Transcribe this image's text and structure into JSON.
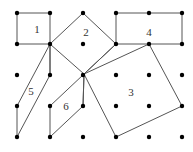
{
  "diagram": {
    "title": "",
    "line_color": "#555555",
    "dot_color": "#000000",
    "grid": {
      "xs": [
        17,
        50,
        83,
        116,
        149,
        182
      ],
      "ys": [
        13,
        44,
        75,
        106,
        137
      ]
    },
    "pivot": [
      84,
      74
    ],
    "shapes": [
      {
        "id": "1",
        "label": "1",
        "label_pos": [
          37,
          33
        ],
        "points": [
          [
            17,
            13
          ],
          [
            50,
            13
          ],
          [
            50,
            44
          ],
          [
            17,
            44
          ]
        ]
      },
      {
        "id": "2",
        "label": "2",
        "label_pos": [
          86,
          36
        ],
        "points": [
          [
            50,
            44
          ],
          [
            83,
            13
          ],
          [
            116,
            44
          ],
          [
            84,
            74
          ]
        ]
      },
      {
        "id": "4",
        "label": "4",
        "label_pos": [
          149,
          36
        ],
        "points": [
          [
            116,
            13
          ],
          [
            182,
            13
          ],
          [
            182,
            44
          ],
          [
            116,
            44
          ]
        ]
      },
      {
        "id": "3",
        "label": "3",
        "label_pos": [
          131,
          96
        ],
        "points": [
          [
            84,
            74
          ],
          [
            149,
            44
          ],
          [
            182,
            106
          ],
          [
            116,
            137
          ]
        ]
      },
      {
        "id": "5",
        "label": "5",
        "label_pos": [
          31,
          95
        ],
        "points": [
          [
            50,
            44
          ],
          [
            17,
            106
          ],
          [
            17,
            137
          ],
          [
            50,
            75
          ]
        ]
      },
      {
        "id": "6",
        "label": "6",
        "label_pos": [
          66,
          110
        ],
        "points": [
          [
            84,
            74
          ],
          [
            50,
            106
          ],
          [
            50,
            137
          ],
          [
            83,
            106
          ]
        ]
      }
    ],
    "extra_lines": [
      [
        [
          50,
          44
        ],
        [
          50,
          75
        ]
      ],
      [
        [
          84,
          74
        ],
        [
          116,
          44
        ]
      ],
      [
        [
          84,
          74
        ],
        [
          83,
          106
        ]
      ]
    ]
  }
}
